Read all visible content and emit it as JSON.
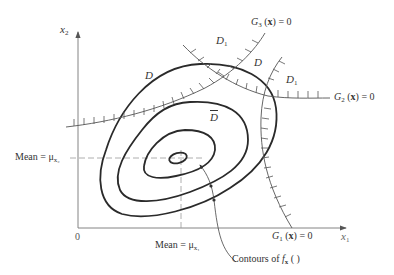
{
  "diagram": {
    "axes": {
      "x_label": "x",
      "x_label_sub": "1",
      "y_label": "x",
      "y_label_sub": "2",
      "origin_label": "0"
    },
    "means": {
      "x2_label": "Mean = μ",
      "x2_sub": "x₂",
      "x1_label": "Mean = μ",
      "x1_sub": "x₁"
    },
    "constraints": [
      {
        "id": "G1",
        "label_prefix": "G",
        "label_sub": "1",
        "label_arg": " (",
        "label_x": "x",
        "label_suffix": ") = 0"
      },
      {
        "id": "G2",
        "label_prefix": "G",
        "label_sub": "2",
        "label_arg": " (",
        "label_x": "x",
        "label_suffix": ") = 0"
      },
      {
        "id": "G3",
        "label_prefix": "G",
        "label_sub": "3",
        "label_arg": " (",
        "label_x": "x",
        "label_suffix": ") = 0"
      }
    ],
    "regions": {
      "D_left": "D",
      "D_top": "D",
      "D1_top": "D",
      "D1_top_sub": "1",
      "D1_right": "D",
      "D1_right_sub": "1",
      "D_bar": "D"
    },
    "contours_annotation": {
      "text": "Contours of ",
      "f": "f",
      "f_sub": "x",
      "paren": " ( )"
    },
    "colors": {
      "contour": "#2a2a2a",
      "constraint": "#555555",
      "axis": "#777777",
      "dashed": "#999999"
    }
  }
}
